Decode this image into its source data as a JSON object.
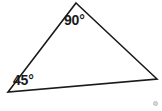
{
  "figure": {
    "type": "geometry-diagram",
    "shape": "triangle",
    "background_color": "#ffffff",
    "stroke_color": "#1a1a1a",
    "stroke_width": 1.6,
    "fill": "none",
    "vertices": [
      {
        "name": "apex",
        "x": 76,
        "y": 3
      },
      {
        "name": "right",
        "x": 157,
        "y": 79
      },
      {
        "name": "left",
        "x": 8,
        "y": 92
      }
    ],
    "edges": [
      {
        "name": "left-edge",
        "from": "left",
        "to": "apex"
      },
      {
        "name": "right-edge",
        "from": "apex",
        "to": "right"
      },
      {
        "name": "bottom-edge",
        "from": "right",
        "to": "left"
      }
    ],
    "angle_labels": [
      {
        "id": "apex",
        "value": "90",
        "unit": "°",
        "text": "90°"
      },
      {
        "id": "left",
        "value": "45",
        "unit": "°",
        "text": "45°"
      }
    ],
    "artifact": {
      "name": "corner-speck",
      "color": "#d8d8d8"
    }
  }
}
